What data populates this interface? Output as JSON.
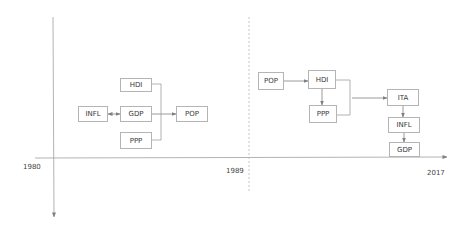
{
  "timeline": {
    "years": [
      {
        "label": "1980"
      },
      {
        "label": "1989"
      },
      {
        "label": "2017"
      }
    ]
  },
  "period_1980_1989": {
    "nodes": {
      "hdi": "HDI",
      "infl": "INFL",
      "gdp": "GDP",
      "pop": "POP",
      "ppp": "PPP"
    },
    "edges": [
      {
        "from": "INFL",
        "to": "GDP",
        "type": "bidirectional"
      },
      {
        "from": "GDP",
        "to": "POP",
        "type": "directed"
      },
      {
        "from": "HDI",
        "to": "POP",
        "type": "bracket"
      },
      {
        "from": "PPP",
        "to": "POP",
        "type": "bracket"
      }
    ]
  },
  "period_1989_2017": {
    "nodes": {
      "pop": "POP",
      "hdi": "HDI",
      "ppp": "PPP",
      "ita": "ITA",
      "infl": "INFL",
      "gdp": "GDP"
    },
    "edges": [
      {
        "from": "POP",
        "to": "HDI",
        "type": "directed"
      },
      {
        "from": "HDI",
        "to": "PPP",
        "type": "directed"
      },
      {
        "from": "HDI",
        "to": "ITA",
        "type": "bracket"
      },
      {
        "from": "PPP",
        "to": "ITA",
        "type": "bracket"
      },
      {
        "from": "ITA",
        "to": "INFL",
        "type": "directed"
      },
      {
        "from": "INFL",
        "to": "GDP",
        "type": "directed"
      }
    ]
  },
  "colors": {
    "axis": "#9a9a9a",
    "box_border": "#b4b4b4",
    "arrow": "#808080",
    "text": "#3a3a3a"
  }
}
